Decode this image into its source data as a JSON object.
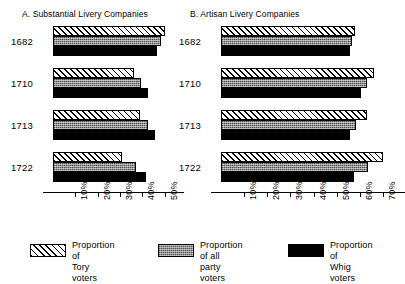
{
  "chart_data": {
    "type": "bar",
    "orientation": "horizontal",
    "title": "",
    "grid": false,
    "legend_position": "bottom",
    "categories": [
      "1682",
      "1710",
      "1713",
      "1722"
    ],
    "panels": [
      {
        "key": "a",
        "title": "A. Substantial Livery Companies",
        "xlabel": "",
        "ylabel": "",
        "xlim": [
          0,
          55
        ],
        "xticks": [
          10,
          20,
          30,
          40,
          50
        ],
        "xticklabels": [
          "10%",
          "20%",
          "30%",
          "40%",
          "50%"
        ],
        "series": [
          {
            "name": "Proportion of Tory voters",
            "key": "tory",
            "values": [
              50.0,
              36.0,
              39.0,
              31.0
            ]
          },
          {
            "name": "Proportion of all party voters",
            "key": "all",
            "values": [
              48.5,
              39.5,
              42.5,
              37.0
            ]
          },
          {
            "name": "Proportion of Whig voters",
            "key": "whig",
            "values": [
              46.5,
              42.5,
              45.5,
              41.5
            ]
          }
        ]
      },
      {
        "key": "b",
        "title": "B. Artisan Livery Companies",
        "xlabel": "",
        "ylabel": "",
        "xlim": [
          0,
          76
        ],
        "xticks": [
          10,
          20,
          30,
          40,
          50,
          60,
          70
        ],
        "xticklabels": [
          "10%",
          "20%",
          "30%",
          "40%",
          "50%",
          "60%",
          "70%"
        ],
        "series": [
          {
            "name": "Proportion of Tory voters",
            "key": "tory",
            "values": [
              58.0,
              66.0,
              63.0,
              70.0
            ]
          },
          {
            "name": "Proportion of all party voters",
            "key": "all",
            "values": [
              56.5,
              63.0,
              58.5,
              63.5
            ]
          },
          {
            "name": "Proportion of Whig voters",
            "key": "whig",
            "values": [
              55.5,
              60.5,
              55.5,
              57.5
            ]
          }
        ]
      }
    ],
    "legend": [
      {
        "key": "tory",
        "label": "Proportion of\nTory voters"
      },
      {
        "key": "all",
        "label": "Proportion of all\nparty voters"
      },
      {
        "key": "whig",
        "label": "Proportion of\nWhig voters"
      }
    ]
  }
}
